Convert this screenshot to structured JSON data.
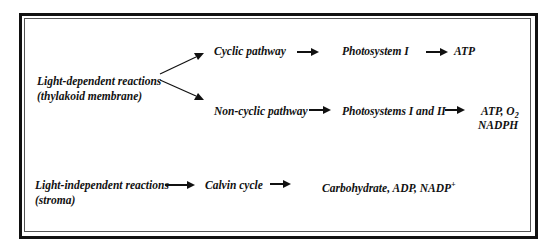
{
  "light_dependent": {
    "label": "Light-dependent reactions",
    "location": "(thylakoid membrane)",
    "cyclic": {
      "pathway": "Cyclic pathway",
      "system": "Photosystem I",
      "products": "ATP"
    },
    "non_cyclic": {
      "pathway": "Non-cyclic pathway",
      "system": "Photosystems I and II",
      "products_line1_prefix": "ATP, O",
      "products_line1_sub": "2",
      "products_line2": "NADPH"
    }
  },
  "light_independent": {
    "label": "Light-independent reactions",
    "location": "(stroma)",
    "cycle": "Calvin cycle",
    "products_prefix": "Carbohydrate, ADP, NADP",
    "products_sup": "+"
  }
}
